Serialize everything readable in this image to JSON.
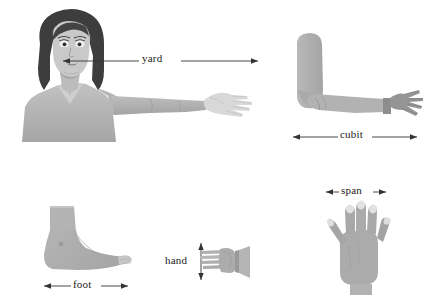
{
  "illustration": {
    "title": "Body-based units of measurement",
    "background_color": "#ffffff",
    "ink_color": "#2b2b2b",
    "skin_color": "#b3b3b3",
    "skin_shadow_color": "#9d9d9d",
    "skin_light_color": "#d2d2d2",
    "hair_color": "#3d3d3d",
    "garment_color": "#adadad"
  },
  "figures": [
    {
      "id": "woman-arm-span",
      "name": "woman-with-outstretched-arm",
      "unit": "yard",
      "description": "Woman facing forward with right arm extended horizontally, hand open"
    },
    {
      "id": "forearm",
      "name": "bent-arm-forearm",
      "unit": "cubit",
      "description": "Arm bent at elbow showing forearm length from elbow to fingertips"
    },
    {
      "id": "open-hand",
      "name": "open-hand-spread-fingers",
      "unit": "span",
      "description": "Open hand with fingers spread apart, palm facing viewer"
    },
    {
      "id": "side-hand",
      "name": "hand-side-view",
      "unit": "hand",
      "description": "Hand viewed from the side with fingers extended, measured across the palm width"
    },
    {
      "id": "foot",
      "name": "foot-side-view",
      "unit": "foot",
      "description": "Foot and ankle viewed from the side"
    }
  ],
  "measures": {
    "yard": {
      "label": "yard",
      "arrow_style": "double-ended"
    },
    "cubit": {
      "label": "cubit",
      "arrow_style": "double-ended"
    },
    "span": {
      "label": "span",
      "arrow_style": "double-ended"
    },
    "hand": {
      "label": "hand",
      "arrow_style": "double-ended-vertical"
    },
    "foot": {
      "label": "foot",
      "arrow_style": "double-ended"
    }
  }
}
